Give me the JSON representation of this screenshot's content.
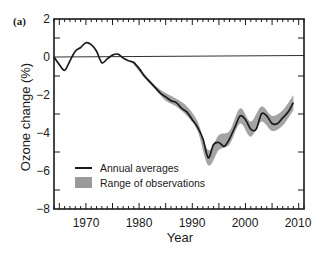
{
  "panel_label": "(a)",
  "chart_data": {
    "type": "line",
    "title": "",
    "panel": "(a)",
    "xlabel": "Year",
    "ylabel": "Ozone change (%)",
    "xlim": [
      1964,
      2011
    ],
    "ylim": [
      -8,
      2
    ],
    "x_ticks": [
      1970,
      1980,
      1990,
      2000,
      2010
    ],
    "y_ticks": [
      2,
      0,
      -2,
      -4,
      -6,
      -8
    ],
    "grid": false,
    "legend_position": "lower-left inside",
    "reference_line": {
      "y": 0,
      "description": "zero baseline"
    },
    "series": [
      {
        "name": "Annual averages",
        "style": "line",
        "color": "#1a1a1a",
        "x": [
          1964,
          1965,
          1966,
          1967,
          1968,
          1969,
          1970,
          1971,
          1972,
          1973,
          1974,
          1975,
          1976,
          1977,
          1978,
          1979,
          1980,
          1981,
          1982,
          1983,
          1984,
          1985,
          1986,
          1987,
          1988,
          1989,
          1990,
          1991,
          1992,
          1993,
          1994,
          1995,
          1996,
          1997,
          1998,
          1999,
          2000,
          2001,
          2002,
          2003,
          2004,
          2005,
          2006,
          2007,
          2008,
          2009
        ],
        "values": [
          0.0,
          -0.4,
          -0.7,
          -0.2,
          0.3,
          0.5,
          0.75,
          0.65,
          0.3,
          -0.3,
          -0.1,
          0.1,
          0.15,
          -0.05,
          -0.2,
          -0.3,
          -0.6,
          -1.0,
          -1.3,
          -1.6,
          -1.9,
          -2.1,
          -2.3,
          -2.4,
          -2.7,
          -2.9,
          -3.3,
          -3.7,
          -4.3,
          -5.3,
          -4.6,
          -4.5,
          -4.7,
          -4.3,
          -3.7,
          -3.1,
          -3.3,
          -3.8,
          -3.8,
          -3.0,
          -3.1,
          -3.5,
          -3.5,
          -3.2,
          -2.9,
          -2.4
        ]
      },
      {
        "name": "Range of observations",
        "style": "band",
        "color": "#9a9a9a",
        "x": [
          1979,
          1981,
          1983,
          1985,
          1987,
          1989,
          1991,
          1993,
          1995,
          1997,
          1999,
          2001,
          2003,
          2005,
          2007,
          2009
        ],
        "lower": [
          -0.4,
          -1.1,
          -1.7,
          -2.3,
          -2.6,
          -3.1,
          -3.9,
          -5.7,
          -4.9,
          -4.6,
          -3.5,
          -4.2,
          -3.4,
          -3.9,
          -3.6,
          -2.8
        ],
        "upper": [
          -0.2,
          -0.9,
          -1.5,
          -1.9,
          -2.2,
          -2.6,
          -3.4,
          -4.9,
          -4.1,
          -3.9,
          -2.7,
          -3.4,
          -2.6,
          -3.1,
          -2.8,
          -2.0
        ]
      }
    ]
  },
  "axes": {
    "xlabel": "Year",
    "ylabel": "Ozone change (%)",
    "x_tick_labels": [
      "1970",
      "1980",
      "1990",
      "2000",
      "2010"
    ],
    "y_tick_labels": [
      "2",
      "0",
      "−2",
      "−4",
      "−6",
      "−8"
    ]
  },
  "legend": {
    "items": [
      {
        "label": "Annual averages",
        "symbol": "line"
      },
      {
        "label": "Range of observations",
        "symbol": "swatch"
      }
    ]
  }
}
